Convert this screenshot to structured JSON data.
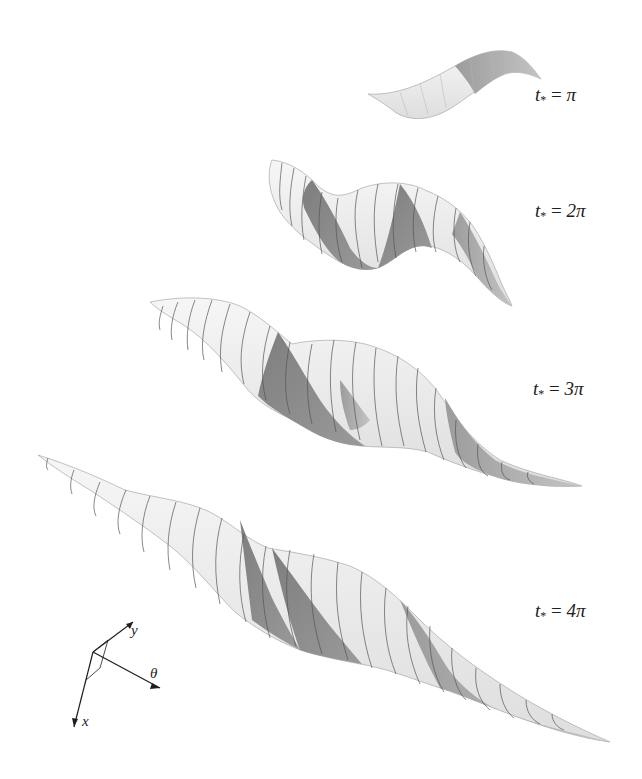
{
  "figure": {
    "panels": [
      {
        "id": "pi",
        "label_var": "t",
        "label_sub": "*",
        "label_eq": " = ",
        "label_val": "π"
      },
      {
        "id": "2pi",
        "label_var": "t",
        "label_sub": "*",
        "label_eq": " = ",
        "label_val": "2π"
      },
      {
        "id": "3pi",
        "label_var": "t",
        "label_sub": "*",
        "label_eq": " = ",
        "label_val": "3π"
      },
      {
        "id": "4pi",
        "label_var": "t",
        "label_sub": "*",
        "label_eq": " = ",
        "label_val": "4π"
      }
    ],
    "axes": {
      "x": "x",
      "y": "y",
      "theta": "θ"
    },
    "colors": {
      "light_band": "#ececec",
      "dark_band": "#8a8a8a",
      "mid_band": "#a9a9a9",
      "stripe": "#555555",
      "background": "#ffffff"
    }
  }
}
